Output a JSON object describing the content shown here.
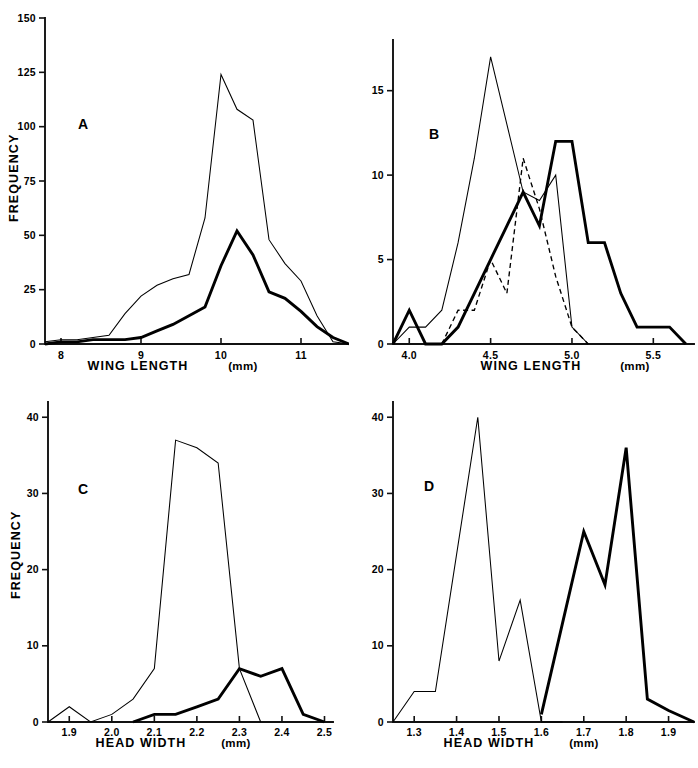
{
  "figure": {
    "panel_count": 4
  },
  "panels": {
    "A": {
      "letter": "A",
      "xlabel_main": "WING LENGTH",
      "xlabel_unit": "(mm)",
      "ylabel": "FREQUENCY",
      "x_ticks": [
        "8",
        "9",
        "10",
        "11"
      ],
      "y_ticks": [
        "0",
        "25",
        "50",
        "75",
        "100",
        "125",
        "150"
      ]
    },
    "B": {
      "letter": "B",
      "xlabel_main": "WING LENGTH",
      "xlabel_unit": "(mm)",
      "ylabel": "",
      "x_ticks": [
        "4.0",
        "4.5",
        "5.0",
        "5.5"
      ],
      "y_ticks": [
        "0",
        "5",
        "10",
        "15"
      ]
    },
    "C": {
      "letter": "C",
      "xlabel_main": "HEAD WIDTH",
      "xlabel_unit": "(mm)",
      "ylabel": "FREQUENCY",
      "x_ticks": [
        "1.9",
        "2.0",
        "2.1",
        "2.2",
        "2.3",
        "2.4",
        "2.5"
      ],
      "y_ticks": [
        "0",
        "10",
        "20",
        "30",
        "40"
      ]
    },
    "D": {
      "letter": "D",
      "xlabel_main": "HEAD WIDTH",
      "xlabel_unit": "(mm)",
      "ylabel": "",
      "x_ticks": [
        "1.3",
        "1.4",
        "1.5",
        "1.6",
        "1.7",
        "1.8",
        "1.9"
      ],
      "y_ticks": [
        "0",
        "10",
        "20",
        "30",
        "40"
      ]
    }
  },
  "chart_data": [
    {
      "panel": "A",
      "type": "line",
      "title": "A",
      "xlabel": "WING LENGTH (mm)",
      "ylabel": "FREQUENCY",
      "xlim": [
        7.8,
        11.6
      ],
      "ylim": [
        0,
        150
      ],
      "xticks": [
        8,
        9,
        10,
        11
      ],
      "yticks": [
        0,
        25,
        50,
        75,
        100,
        125,
        150
      ],
      "grid": false,
      "legend": "none",
      "series": [
        {
          "name": "thin-line",
          "style": "thin-solid",
          "x": [
            7.8,
            8.0,
            8.2,
            8.4,
            8.6,
            8.8,
            9.0,
            9.2,
            9.4,
            9.6,
            9.8,
            10.0,
            10.2,
            10.4,
            10.6,
            10.8,
            11.0,
            11.2,
            11.4,
            11.6
          ],
          "y": [
            1,
            2,
            2,
            3,
            4,
            14,
            22,
            27,
            30,
            32,
            58,
            124,
            108,
            103,
            48,
            37,
            29,
            13,
            1,
            0
          ]
        },
        {
          "name": "thick-line",
          "style": "thick-solid",
          "x": [
            7.8,
            8.0,
            8.2,
            8.4,
            8.6,
            8.8,
            9.0,
            9.2,
            9.4,
            9.6,
            9.8,
            10.0,
            10.2,
            10.4,
            10.6,
            10.8,
            11.0,
            11.2,
            11.4,
            11.6
          ],
          "y": [
            0,
            1,
            1,
            2,
            2,
            2,
            3,
            6,
            9,
            13,
            17,
            36,
            52,
            41,
            24,
            21,
            15,
            8,
            3,
            0
          ]
        }
      ]
    },
    {
      "panel": "B",
      "type": "line",
      "title": "B",
      "xlabel": "WING LENGTH (mm)",
      "ylabel": "FREQUENCY",
      "xlim": [
        3.9,
        5.75
      ],
      "ylim": [
        0,
        18
      ],
      "xticks": [
        4.0,
        4.5,
        5.0,
        5.5
      ],
      "yticks": [
        0,
        5,
        10,
        15
      ],
      "grid": false,
      "legend": "none",
      "series": [
        {
          "name": "thin-line",
          "style": "thin-solid",
          "x": [
            3.9,
            4.0,
            4.1,
            4.2,
            4.3,
            4.4,
            4.5,
            4.6,
            4.7,
            4.8,
            4.9,
            5.0,
            5.1
          ],
          "y": [
            0,
            1,
            1,
            2,
            6,
            11,
            17,
            13,
            9,
            8.5,
            10,
            1,
            0
          ]
        },
        {
          "name": "thick-line",
          "style": "thick-solid",
          "x": [
            3.9,
            4.0,
            4.1,
            4.2,
            4.3,
            4.4,
            4.5,
            4.6,
            4.7,
            4.8,
            4.9,
            5.0,
            5.1,
            5.2,
            5.3,
            5.4,
            5.5,
            5.6,
            5.7
          ],
          "y": [
            0,
            2,
            0,
            0,
            1,
            3,
            5,
            7,
            9,
            7,
            12,
            12,
            6,
            6,
            3,
            1,
            1,
            1,
            0
          ]
        },
        {
          "name": "dashed-line",
          "style": "dashed",
          "x": [
            4.2,
            4.3,
            4.4,
            4.5,
            4.6,
            4.7,
            4.8,
            4.9,
            5.0,
            5.1
          ],
          "y": [
            0,
            2,
            2,
            5,
            3,
            11,
            8,
            4,
            1,
            0
          ]
        }
      ]
    },
    {
      "panel": "C",
      "type": "line",
      "title": "C",
      "xlabel": "HEAD WIDTH (mm)",
      "ylabel": "FREQUENCY",
      "xlim": [
        1.85,
        2.52
      ],
      "ylim": [
        0,
        42
      ],
      "xticks": [
        1.9,
        2.0,
        2.1,
        2.2,
        2.3,
        2.4,
        2.5
      ],
      "yticks": [
        0,
        10,
        20,
        30,
        40
      ],
      "grid": false,
      "legend": "none",
      "series": [
        {
          "name": "thin-line",
          "style": "thin-solid",
          "x": [
            1.85,
            1.9,
            1.95,
            2.0,
            2.05,
            2.1,
            2.15,
            2.2,
            2.25,
            2.3,
            2.35
          ],
          "y": [
            0,
            2,
            0,
            1,
            3,
            7,
            37,
            36,
            34,
            7,
            0
          ]
        },
        {
          "name": "thick-line",
          "style": "thick-solid",
          "x": [
            2.05,
            2.1,
            2.15,
            2.2,
            2.25,
            2.3,
            2.35,
            2.4,
            2.45,
            2.5
          ],
          "y": [
            0,
            1,
            1,
            2,
            3,
            7,
            6,
            7,
            1,
            0
          ]
        }
      ]
    },
    {
      "panel": "D",
      "type": "line",
      "title": "D",
      "xlabel": "HEAD WIDTH (mm)",
      "ylabel": "FREQUENCY",
      "xlim": [
        1.25,
        1.96
      ],
      "ylim": [
        0,
        42
      ],
      "xticks": [
        1.3,
        1.4,
        1.5,
        1.6,
        1.7,
        1.8,
        1.9
      ],
      "yticks": [
        0,
        10,
        20,
        30,
        40
      ],
      "grid": false,
      "legend": "none",
      "series": [
        {
          "name": "thin-line",
          "style": "thin-solid",
          "x": [
            1.25,
            1.3,
            1.35,
            1.4,
            1.45,
            1.5,
            1.55,
            1.6,
            1.65
          ],
          "y": [
            0,
            4,
            4,
            22,
            40,
            8,
            16,
            0,
            0
          ]
        },
        {
          "name": "thick-line",
          "style": "thick-solid",
          "x": [
            1.6,
            1.65,
            1.7,
            1.75,
            1.8,
            1.85,
            1.9,
            1.96
          ],
          "y": [
            1,
            13,
            25,
            18,
            36,
            3,
            1.5,
            0
          ]
        }
      ]
    }
  ]
}
